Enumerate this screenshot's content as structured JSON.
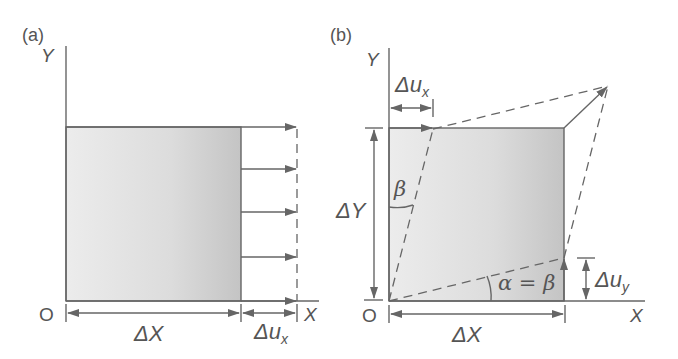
{
  "panels": {
    "a": {
      "label": "(a)",
      "axis_y": "Y",
      "axis_x": "X",
      "origin": "O",
      "dim_width": "ΔX",
      "dim_disp_base": "Δu",
      "dim_disp_sub": "x",
      "arrow_count": 5
    },
    "b": {
      "label": "(b)",
      "axis_y": "Y",
      "axis_x": "X",
      "origin": "O",
      "dim_width": "ΔX",
      "dim_height": "ΔY",
      "dim_disp_x_base": "Δu",
      "dim_disp_x_sub": "x",
      "dim_disp_y_base": "Δu",
      "dim_disp_y_sub": "y",
      "angle_beta": "β",
      "angle_relation": "α = β"
    }
  },
  "colors": {
    "line": "#666666",
    "text": "#555555",
    "fill_light": "#ececec",
    "fill_dark": "#c4c4c4"
  }
}
